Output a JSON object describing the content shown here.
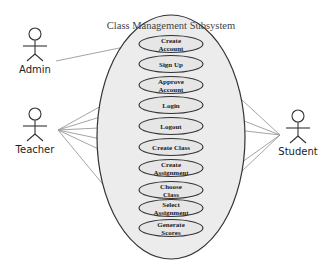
{
  "diagram": {
    "type": "use-case",
    "title": "Class Management Subsystem",
    "actors": [
      {
        "id": "admin",
        "label": "Admin"
      },
      {
        "id": "teacher",
        "label": "Teacher"
      },
      {
        "id": "student",
        "label": "Student"
      }
    ],
    "use_cases": [
      {
        "id": "create-account",
        "lines": [
          "Create",
          "Account"
        ]
      },
      {
        "id": "sign-up",
        "lines": [
          "Sign Up"
        ]
      },
      {
        "id": "approve-account",
        "lines": [
          "Approve",
          "Account"
        ]
      },
      {
        "id": "login",
        "lines": [
          "Login"
        ]
      },
      {
        "id": "logout",
        "lines": [
          "Logout"
        ]
      },
      {
        "id": "create-class",
        "lines": [
          "Create Class"
        ]
      },
      {
        "id": "create-assignment",
        "lines": [
          "Create",
          "Assignment"
        ]
      },
      {
        "id": "choose-class",
        "lines": [
          "Choose",
          "Class"
        ]
      },
      {
        "id": "select-assignment",
        "lines": [
          "Select",
          "Assignment"
        ]
      },
      {
        "id": "generate-scores",
        "lines": [
          "Generate",
          "Scores"
        ]
      }
    ],
    "associations": [
      {
        "actor": "admin",
        "use_case": "create-account"
      },
      {
        "actor": "teacher",
        "use_case": "approve-account"
      },
      {
        "actor": "teacher",
        "use_case": "login"
      },
      {
        "actor": "teacher",
        "use_case": "logout"
      },
      {
        "actor": "teacher",
        "use_case": "create-class"
      },
      {
        "actor": "teacher",
        "use_case": "create-assignment"
      },
      {
        "actor": "teacher",
        "use_case": "generate-scores"
      },
      {
        "actor": "student",
        "use_case": "sign-up"
      },
      {
        "actor": "student",
        "use_case": "login"
      },
      {
        "actor": "student",
        "use_case": "logout"
      },
      {
        "actor": "student",
        "use_case": "choose-class"
      },
      {
        "actor": "student",
        "use_case": "select-assignment"
      }
    ],
    "colors": {
      "boundary_fill": "#ececec",
      "boundary_stroke": "#333333",
      "usecase_fill": "#e6e6e6",
      "usecase_stroke": "#333333",
      "line": "#9a9a9a",
      "actor": "#333333"
    }
  }
}
